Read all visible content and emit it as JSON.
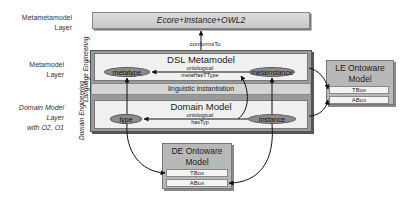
{
  "layers": {
    "metametamodel": [
      "Metametamodel",
      "Layer"
    ],
    "metamodel": [
      "Metamodel",
      "Layer"
    ],
    "domain_model": [
      "Domain Model",
      "Layer",
      "with O2, O1"
    ]
  },
  "metametamodel_box": {
    "title": "Ecore+Instance+OWL2"
  },
  "conforms_label": "conformsTo",
  "side_labels": {
    "language_engineering": "Language Engineering",
    "domain_engineering": "Domain Engineering"
  },
  "dsl_metamodel": {
    "title": "DSL Metamodel",
    "relation_top": "ontological",
    "relation_bottom": "metaHasTType",
    "left_node": "metatype",
    "right_node": "metainstance"
  },
  "linguistic_band": "linguistic instantiation",
  "domain_model": {
    "title": "Domain Model",
    "relation_top": "ontological",
    "relation_bottom": "hasTyp",
    "left_node": "type",
    "right_node": "Instance"
  },
  "le_ontoware": {
    "title_line1": "LE Ontoware",
    "title_line2": "Model",
    "tbox": "TBox",
    "abox": "ABox"
  },
  "de_ontoware": {
    "title_line1": "DE Ontoware",
    "title_line2": "Model",
    "tbox": "TBox",
    "abox": "ABox"
  }
}
